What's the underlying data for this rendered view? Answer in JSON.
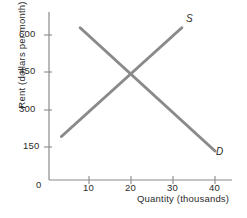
{
  "chart_data": {
    "type": "line",
    "title": "",
    "xlabel": "Quantity (thousands)",
    "ylabel": "Rent (dollars per month)",
    "xlim": [
      0,
      44
    ],
    "ylim": [
      0,
      720
    ],
    "xticks": [
      0,
      10,
      20,
      30,
      40
    ],
    "xtick_labels": [
      "0",
      "10",
      "20",
      "30",
      "40"
    ],
    "yticks": [
      0,
      150,
      300,
      450,
      600
    ],
    "ytick_labels": [
      "0",
      "150",
      "300",
      "450",
      "600"
    ],
    "grid": false,
    "legend_position": "inline-end-labels",
    "series": [
      {
        "name": "S",
        "label": "S",
        "description": "Supply curve, upward sloping",
        "color": "#8a8a8a",
        "x": [
          3,
          32
        ],
        "y": [
          180,
          630
        ],
        "label_position": {
          "x": 33,
          "y": 680
        }
      },
      {
        "name": "D",
        "label": "D",
        "description": "Demand curve, downward sloping",
        "color": "#8a8a8a",
        "x": [
          7.5,
          40
        ],
        "y": [
          630,
          120
        ],
        "label_position": {
          "x": 41,
          "y": 105
        }
      }
    ],
    "annotations": [
      {
        "name": "equilibrium",
        "x": 20,
        "y": 450,
        "text": ""
      }
    ],
    "axis_color": "#8a8a8a",
    "text_color": "#2b2b2b",
    "background": "#ffffff"
  }
}
